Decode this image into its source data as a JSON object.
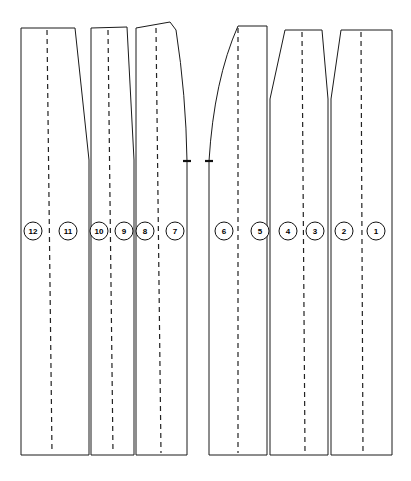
{
  "figure": {
    "type": "technical-pattern-drawing",
    "canvas": {
      "width": 411,
      "height": 481
    },
    "background_color": "#ffffff",
    "line_color": "#1a1a1a",
    "dash_color": "#222222"
  },
  "groups": [
    {
      "id": "left-group",
      "name": "left-panel-group",
      "panel_count": 6,
      "bounds": {
        "x_left": 21,
        "x_right": 190,
        "y_top": 26,
        "y_bottom": 455
      }
    },
    {
      "id": "right-group",
      "name": "right-panel-group",
      "panel_count": 6,
      "bounds": {
        "x_left": 208,
        "x_right": 392,
        "y_top": 26,
        "y_bottom": 455
      }
    }
  ],
  "panels": [
    {
      "id": "panel-12-11",
      "labels": [
        "12",
        "11"
      ],
      "outline": "M 21 28 L 75 28 L 89 160 L 89 455 L 21 455 Z",
      "center_line": "M 47 30 L 52 453",
      "label_points": [
        {
          "text": "12",
          "x": 33,
          "y": 231
        },
        {
          "text": "11",
          "x": 68,
          "y": 231
        }
      ]
    },
    {
      "id": "panel-10-9",
      "labels": [
        "10",
        "9"
      ],
      "outline": "M 91 28 L 127 27 L 134 160 L 134 455 L 91 455 Z",
      "center_line": "M 108 30 L 113 453",
      "label_points": [
        {
          "text": "10",
          "x": 99,
          "y": 231
        },
        {
          "text": "9",
          "x": 124,
          "y": 231
        }
      ]
    },
    {
      "id": "panel-8-7",
      "labels": [
        "8",
        "7"
      ],
      "outline": "M 136 28 L 170 22 L 176 30 Q 186 95 187 161 L 187 455 L 136 455 Z",
      "center_line": "M 156 28 L 161 453",
      "label_points": [
        {
          "text": "8",
          "x": 145,
          "y": 231
        },
        {
          "text": "7",
          "x": 175,
          "y": 231
        }
      ]
    },
    {
      "id": "panel-6-5",
      "labels": [
        "6",
        "5"
      ],
      "outline": "M 209 161 Q 214 80 238 26 L 267 26 L 267 455 L 209 455 Z",
      "center_line": "M 238 28 L 238 453",
      "label_points": [
        {
          "text": "6",
          "x": 224,
          "y": 231
        },
        {
          "text": "5",
          "x": 260,
          "y": 231
        }
      ]
    },
    {
      "id": "panel-4-3",
      "labels": [
        "4",
        "3"
      ],
      "outline": "M 270 455 L 270 99 L 285 30 L 322 30 L 328 99 L 328 455 Z",
      "center_line": "M 302 32 L 305 453",
      "label_points": [
        {
          "text": "4",
          "x": 288,
          "y": 231
        },
        {
          "text": "3",
          "x": 315,
          "y": 231
        }
      ]
    },
    {
      "id": "panel-2-1",
      "labels": [
        "2",
        "1"
      ],
      "outline": "M 331 455 L 331 99 L 341 30 L 392 30 L 392 455 Z",
      "center_line": "M 361 32 L 363 453",
      "label_points": [
        {
          "text": "2",
          "x": 344,
          "y": 231
        },
        {
          "text": "1",
          "x": 376,
          "y": 231
        }
      ]
    }
  ],
  "notch_ticks": [
    {
      "id": "notch-left-group-right-edge",
      "x1": 183,
      "y1": 161,
      "x2": 191,
      "y2": 161
    },
    {
      "id": "notch-right-group-left-edge",
      "x1": 205,
      "y1": 161,
      "x2": 213,
      "y2": 161
    }
  ],
  "callouts": [
    {
      "number": "12",
      "x": 33,
      "y": 231,
      "r": 9
    },
    {
      "number": "11",
      "x": 68,
      "y": 231,
      "r": 9
    },
    {
      "number": "10",
      "x": 99,
      "y": 231,
      "r": 9
    },
    {
      "number": "9",
      "x": 124,
      "y": 231,
      "r": 9
    },
    {
      "number": "8",
      "x": 145,
      "y": 231,
      "r": 9
    },
    {
      "number": "7",
      "x": 175,
      "y": 231,
      "r": 9
    },
    {
      "number": "6",
      "x": 224,
      "y": 231,
      "r": 9
    },
    {
      "number": "5",
      "x": 260,
      "y": 231,
      "r": 9
    },
    {
      "number": "4",
      "x": 288,
      "y": 231,
      "r": 9
    },
    {
      "number": "3",
      "x": 315,
      "y": 231,
      "r": 9
    },
    {
      "number": "2",
      "x": 344,
      "y": 231,
      "r": 9
    },
    {
      "number": "1",
      "x": 376,
      "y": 231,
      "r": 9
    }
  ]
}
